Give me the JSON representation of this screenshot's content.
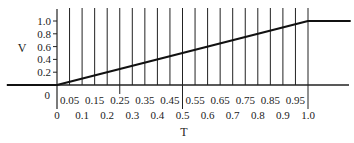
{
  "chart_data": {
    "type": "line",
    "title": "",
    "xlabel": "T",
    "ylabel": "V",
    "xlim": [
      0,
      1.0
    ],
    "ylim": [
      0,
      1.0
    ],
    "grid": false,
    "series": [
      {
        "name": "V(T)",
        "x": [
          -0.2,
          0,
          1.0,
          1.17
        ],
        "y": [
          0,
          0,
          1.0,
          1.0
        ]
      }
    ],
    "y_ticks": [
      {
        "value": 0.2,
        "label": "0.2"
      },
      {
        "value": 0.4,
        "label": "0.4"
      },
      {
        "value": 0.6,
        "label": "0.6"
      },
      {
        "value": 0.8,
        "label": "0.8"
      },
      {
        "value": 1.0,
        "label": "1.0"
      }
    ],
    "origin_label": "0",
    "vertical_lines": [
      0.05,
      0.1,
      0.15,
      0.2,
      0.25,
      0.3,
      0.35,
      0.4,
      0.45,
      0.5,
      0.55,
      0.6,
      0.65,
      0.7,
      0.75,
      0.8,
      0.85,
      0.9,
      0.95,
      1.0
    ],
    "long_ticks": [
      0.25,
      0.5,
      1.0
    ],
    "x_ticks_upper": [
      {
        "value": 0.05,
        "label": "0.05"
      },
      {
        "value": 0.15,
        "label": "0.15"
      },
      {
        "value": 0.25,
        "label": "0.25"
      },
      {
        "value": 0.35,
        "label": "0.35"
      },
      {
        "value": 0.45,
        "label": "0.45"
      },
      {
        "value": 0.55,
        "label": "0.55"
      },
      {
        "value": 0.65,
        "label": "0.65"
      },
      {
        "value": 0.75,
        "label": "0.75"
      },
      {
        "value": 0.85,
        "label": "0.85"
      },
      {
        "value": 0.95,
        "label": "0.95"
      }
    ],
    "x_ticks_lower": [
      {
        "value": 0,
        "label": "0"
      },
      {
        "value": 0.1,
        "label": "0.1"
      },
      {
        "value": 0.2,
        "label": "0.2"
      },
      {
        "value": 0.3,
        "label": "0.3"
      },
      {
        "value": 0.4,
        "label": "0.4"
      },
      {
        "value": 0.5,
        "label": "0.5"
      },
      {
        "value": 0.6,
        "label": "0.6"
      },
      {
        "value": 0.7,
        "label": "0.7"
      },
      {
        "value": 0.8,
        "label": "0.8"
      },
      {
        "value": 0.9,
        "label": "0.9"
      },
      {
        "value": 1.0,
        "label": "1.0"
      }
    ]
  }
}
